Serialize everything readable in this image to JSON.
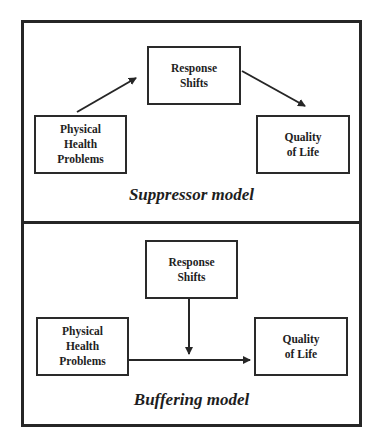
{
  "panels": {
    "suppressor": {
      "title": "Suppressor model",
      "response_shifts": [
        "Response",
        "Shifts"
      ],
      "physical_health": [
        "Physical",
        "Health",
        "Problems"
      ],
      "quality_of_life": [
        "Quality",
        "of Life"
      ]
    },
    "buffering": {
      "title": "Buffering model",
      "response_shifts": [
        "Response",
        "Shifts"
      ],
      "physical_health": [
        "Physical",
        "Health",
        "Problems"
      ],
      "quality_of_life": [
        "Quality",
        "of Life"
      ]
    }
  },
  "colors": {
    "line": "#262626",
    "background": "#ffffff"
  }
}
